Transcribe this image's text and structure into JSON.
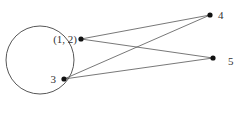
{
  "diagram": {
    "type": "mapping",
    "domain_set": {
      "shape": "circle",
      "elements": [
        {
          "label": "(1, 2)"
        },
        {
          "label": "3"
        }
      ]
    },
    "codomain_points": [
      {
        "label": "4"
      },
      {
        "label": "5"
      }
    ],
    "edges": [
      {
        "from": "(1, 2)",
        "to": "4"
      },
      {
        "from": "(1, 2)",
        "to": "5"
      },
      {
        "from": "3",
        "to": "4"
      },
      {
        "from": "3",
        "to": "5"
      }
    ],
    "colors": {
      "stroke": "#333333",
      "dot": "#111111"
    }
  }
}
